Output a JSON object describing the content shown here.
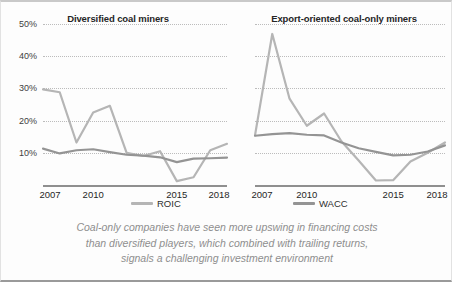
{
  "chart_data": [
    {
      "type": "line",
      "title": "Diversified coal miners",
      "xlabel": "",
      "ylabel": "",
      "ylim": [
        0,
        50
      ],
      "xlim": [
        2007,
        2018
      ],
      "grid": true,
      "gridlines": [
        10,
        20,
        30,
        40,
        50
      ],
      "ytick_labels": [
        "10%",
        "20%",
        "30%",
        "40%",
        "50%"
      ],
      "x": [
        2007,
        2008,
        2009,
        2010,
        2011,
        2012,
        2013,
        2014,
        2015,
        2016,
        2017,
        2018
      ],
      "xtick_values": [
        2007,
        2010,
        2015,
        2018
      ],
      "xtick_labels": [
        "2007",
        "2010",
        "2015",
        "2018"
      ],
      "series": [
        {
          "name": "ROIC",
          "color": "#b5b5b5",
          "values": [
            29.7,
            28.8,
            13.2,
            22.5,
            24.6,
            10.0,
            9.0,
            10.5,
            1.2,
            2.4,
            10.8,
            12.8
          ]
        },
        {
          "name": "WACC",
          "color": "#949494",
          "values": [
            11.3,
            9.8,
            10.8,
            11.1,
            10.2,
            9.4,
            9.1,
            8.6,
            7.1,
            8.2,
            8.3,
            8.5
          ]
        }
      ]
    },
    {
      "type": "line",
      "title": "Export-oriented coal-only miners",
      "xlabel": "",
      "ylabel": "",
      "ylim": [
        0,
        50
      ],
      "xlim": [
        2007,
        2018
      ],
      "grid": true,
      "gridlines": [
        10,
        20,
        30,
        40,
        50
      ],
      "ytick_labels": [
        "10%",
        "20%",
        "30%",
        "40%",
        "50%"
      ],
      "x": [
        2007,
        2008,
        2009,
        2010,
        2011,
        2012,
        2013,
        2014,
        2015,
        2016,
        2017,
        2018
      ],
      "xtick_values": [
        2007,
        2010,
        2015,
        2018
      ],
      "xtick_labels": [
        "2007",
        "2010",
        "2015",
        "2018"
      ],
      "series": [
        {
          "name": "ROIC",
          "color": "#b5b5b5",
          "values": [
            15.4,
            46.9,
            26.8,
            18.4,
            22.2,
            13.6,
            7.6,
            1.4,
            1.5,
            7.3,
            10.0,
            13.2
          ]
        },
        {
          "name": "WACC",
          "color": "#949494",
          "values": [
            15.3,
            15.8,
            16.1,
            15.6,
            15.4,
            13.2,
            11.4,
            10.3,
            9.2,
            9.4,
            10.4,
            12.3
          ]
        }
      ]
    }
  ],
  "charts": {
    "left": {
      "title": "Diversified coal miners"
    },
    "right": {
      "title": "Export-oriented coal-only miners"
    }
  },
  "legend": {
    "roic": "ROIC",
    "wacc": "WACC",
    "roic_color": "#b5b5b5",
    "wacc_color": "#949494"
  },
  "caption": {
    "line1": "Coal-only companies have seen more upswing in financing costs",
    "line2": "than diversified players, which combined with trailing returns,",
    "line3": "signals a challenging investment environment"
  }
}
